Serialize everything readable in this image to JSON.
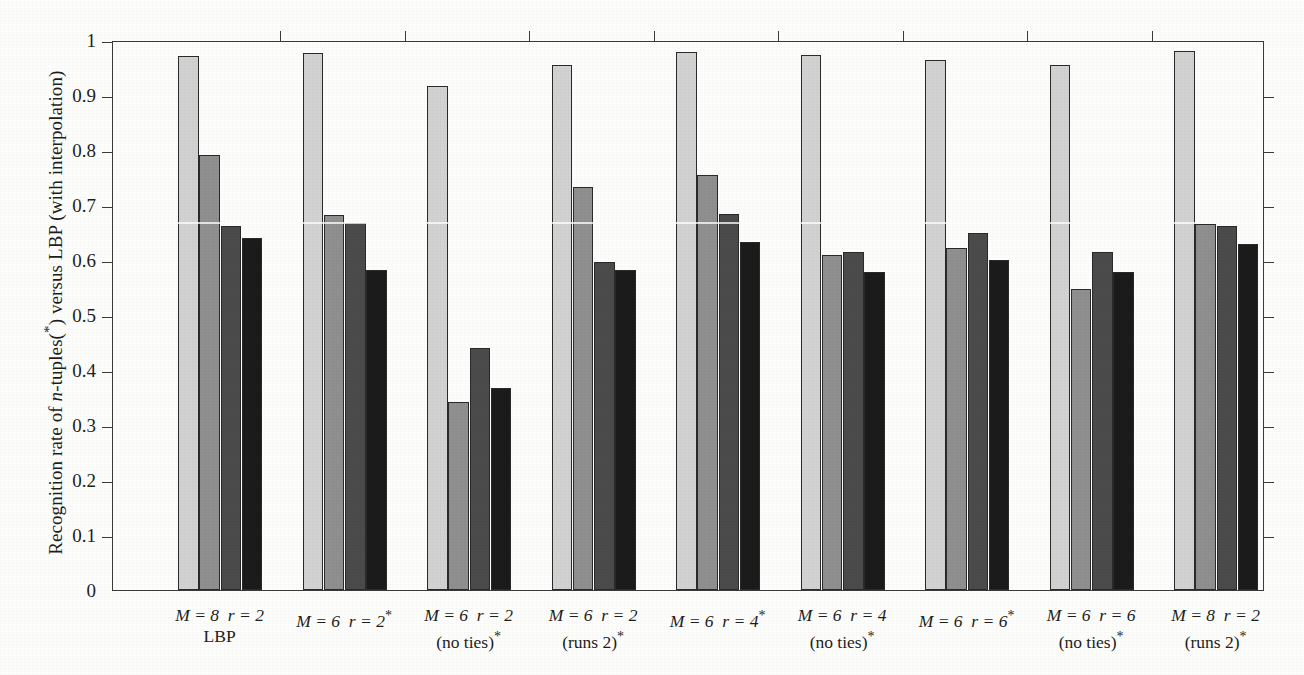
{
  "chart_data": {
    "type": "bar",
    "title": "",
    "subtitle": "",
    "xlabel": "",
    "ylabel": "Recognition rate of n-tuples(*) versus LBP (with interpolation)",
    "ylim": [
      0,
      1
    ],
    "ytick_labels": [
      "0",
      "0.1",
      "0.2",
      "0.3",
      "0.4",
      "0.5",
      "0.6",
      "0.7",
      "0.8",
      "0.9",
      "1"
    ],
    "ytick_values": [
      0,
      0.1,
      0.2,
      0.3,
      0.4,
      0.5,
      0.6,
      0.7,
      0.8,
      0.9,
      1
    ],
    "grid": false,
    "legend": "none",
    "bars_per_group": 4,
    "series": [
      {
        "name": "series-1",
        "color": "#d2d2d2",
        "values": [
          0.971,
          0.977,
          0.917,
          0.955,
          0.979,
          0.972,
          0.963,
          0.955,
          0.98
        ]
      },
      {
        "name": "series-2",
        "color": "#8f8f8f",
        "values": [
          0.791,
          0.681,
          0.342,
          0.733,
          0.755,
          0.61,
          0.621,
          0.548,
          0.666
        ]
      },
      {
        "name": "series-3",
        "color": "#4b4b4b",
        "values": [
          0.661,
          0.667,
          0.44,
          0.596,
          0.684,
          0.615,
          0.649,
          0.615,
          0.661
        ]
      },
      {
        "name": "series-4",
        "color": "#1b1b1b",
        "values": [
          0.64,
          0.582,
          0.368,
          0.582,
          0.633,
          0.578,
          0.6,
          0.578,
          0.63
        ]
      }
    ],
    "categories": [
      {
        "line1_M": "M = 8",
        "line1_r": "r = 2",
        "line1_star": "",
        "line2": "LBP",
        "line2_star": ""
      },
      {
        "line1_M": "M = 6",
        "line1_r": "r = 2",
        "line1_star": "*",
        "line2": "",
        "line2_star": ""
      },
      {
        "line1_M": "M = 6",
        "line1_r": "r = 2",
        "line1_star": "",
        "line2": "(no ties)",
        "line2_star": "*"
      },
      {
        "line1_M": "M = 6",
        "line1_r": "r = 2",
        "line1_star": "",
        "line2": "(runs 2)",
        "line2_star": "*"
      },
      {
        "line1_M": "M = 6",
        "line1_r": "r = 4",
        "line1_star": "*",
        "line2": "",
        "line2_star": ""
      },
      {
        "line1_M": "M = 6",
        "line1_r": "r = 4",
        "line1_star": "",
        "line2": "(no ties)",
        "line2_star": "*"
      },
      {
        "line1_M": "M = 6",
        "line1_r": "r = 6",
        "line1_star": "*",
        "line2": "",
        "line2_star": ""
      },
      {
        "line1_M": "M = 6",
        "line1_r": "r = 6",
        "line1_star": "",
        "line2": "(no ties)",
        "line2_star": "*"
      },
      {
        "line1_M": "M = 8",
        "line1_r": "r = 2",
        "line1_star": "",
        "line2": "(runs 2)",
        "line2_star": "*"
      }
    ]
  },
  "axis_title": {
    "prefix": "Recognition rate of ",
    "italic": "n",
    "mid": "-tuples(",
    "star": "*",
    "suffix": ") versus LBP (with interpolation)"
  },
  "colors": {
    "frame": "#3a3a3a",
    "text": "#1d1d1d",
    "background": "#fdfdfb",
    "series1": "#d2d2d2",
    "series2": "#8f8f8f",
    "series3": "#4b4b4b",
    "series4": "#1b1b1b"
  }
}
